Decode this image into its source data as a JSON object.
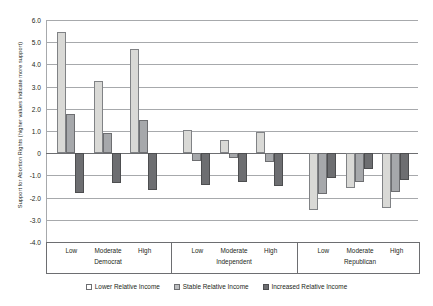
{
  "chart_data": {
    "type": "bar",
    "title": "",
    "xlabel": "",
    "ylabel": "Support for Abortion Rights (higher values indicate more support)",
    "ylim": [
      -4.0,
      6.0
    ],
    "ytick_labels": [
      "6.0",
      "5.0",
      "4.0",
      "3.0",
      "2.0",
      "1.0",
      "0",
      "-1.0",
      "-2.0",
      "-3.0",
      "-4.0"
    ],
    "ytick_values": [
      6,
      5,
      4,
      3,
      2,
      1,
      0,
      -1,
      -2,
      -3,
      -4
    ],
    "grid": true,
    "legend_position": "bottom",
    "categories": [
      "Low",
      "Moderate",
      "High",
      "Low",
      "Moderate",
      "High",
      "Low",
      "Moderate",
      "High"
    ],
    "group_labels": [
      "Democrat",
      "Independent",
      "Republican"
    ],
    "groups": [
      {
        "party": "Democrat",
        "levels": [
          "Low",
          "Moderate",
          "High"
        ]
      },
      {
        "party": "Independent",
        "levels": [
          "Low",
          "Moderate",
          "High"
        ]
      },
      {
        "party": "Republican",
        "levels": [
          "Low",
          "Moderate",
          "High"
        ]
      }
    ],
    "series": [
      {
        "name": "Lower Relative Income",
        "values": [
          5.45,
          3.25,
          4.7,
          1.05,
          0.6,
          0.95,
          -2.55,
          -1.55,
          -2.45
        ]
      },
      {
        "name": "Stable Relative Income",
        "values": [
          1.75,
          0.9,
          1.5,
          -0.35,
          -0.2,
          -0.4,
          -1.85,
          -1.3,
          -1.75
        ]
      },
      {
        "name": "Increased Relative Income",
        "values": [
          -1.8,
          -1.35,
          -1.65,
          -1.45,
          -1.3,
          -1.5,
          -1.1,
          -0.7,
          -1.2
        ]
      }
    ]
  },
  "legend": {
    "items": [
      {
        "label": "Lower Relative Income"
      },
      {
        "label": "Stable Relative Income"
      },
      {
        "label": "Increased Relative Income"
      }
    ]
  }
}
